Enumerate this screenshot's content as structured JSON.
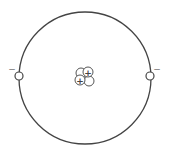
{
  "diagram": {
    "type": "atom-model",
    "nucleus": {
      "protons": 2,
      "neutrons": 2,
      "proton_symbol": "+"
    },
    "electrons": [
      {
        "side": "left",
        "charge_symbol": "−"
      },
      {
        "side": "right",
        "charge_symbol": "−"
      }
    ],
    "colors": {
      "stroke": "#444444",
      "fill": "#ffffff",
      "sign": "#777777"
    }
  }
}
